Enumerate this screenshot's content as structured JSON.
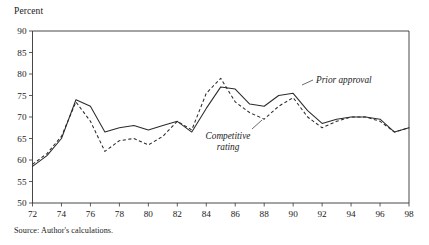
{
  "figure": {
    "axis_title": "Percent",
    "source_note": "Source: Author's calculations."
  },
  "annotations": {
    "prior_approval": "Prior approval",
    "competitive_rating_line1": "Competitive",
    "competitive_rating_line2": "rating"
  },
  "chart_data": {
    "type": "line",
    "title": "",
    "xlabel": "",
    "ylabel": "Percent",
    "xlim": [
      72,
      98
    ],
    "ylim": [
      50,
      90
    ],
    "xticks": [
      72,
      74,
      76,
      78,
      80,
      82,
      84,
      86,
      88,
      90,
      92,
      94,
      96,
      98
    ],
    "xticklabels": [
      "72",
      "74",
      "76",
      "78",
      "80",
      "82",
      "84",
      "86",
      "88",
      "90",
      "92",
      "94",
      "96",
      "98"
    ],
    "yticks": [
      50,
      55,
      60,
      65,
      70,
      75,
      80,
      85,
      90
    ],
    "yticklabels": [
      "50",
      "55",
      "60",
      "65",
      "70",
      "75",
      "80",
      "85",
      "90"
    ],
    "grid": false,
    "legend": "inline-annotations",
    "x": [
      72,
      73,
      74,
      75,
      76,
      77,
      78,
      79,
      80,
      81,
      82,
      83,
      84,
      85,
      86,
      87,
      88,
      89,
      90,
      91,
      92,
      93,
      94,
      95,
      96,
      97,
      98
    ],
    "series": [
      {
        "name": "Prior approval",
        "style": "solid",
        "values": [
          58.5,
          61.0,
          65.0,
          74.0,
          72.5,
          66.5,
          67.5,
          68.0,
          67.0,
          68.0,
          69.0,
          66.5,
          72.0,
          77.0,
          76.5,
          73.0,
          72.5,
          75.0,
          75.5,
          71.5,
          68.5,
          69.5,
          70.0,
          70.0,
          69.5,
          66.5,
          67.5
        ]
      },
      {
        "name": "Competitive rating",
        "style": "dashed",
        "values": [
          59.0,
          61.5,
          65.5,
          73.5,
          69.0,
          62.0,
          64.5,
          65.0,
          63.5,
          65.5,
          69.0,
          67.0,
          75.5,
          79.0,
          73.5,
          71.0,
          69.5,
          72.5,
          74.5,
          70.0,
          67.5,
          69.0,
          70.0,
          70.0,
          69.0,
          66.5,
          67.5
        ]
      }
    ]
  }
}
